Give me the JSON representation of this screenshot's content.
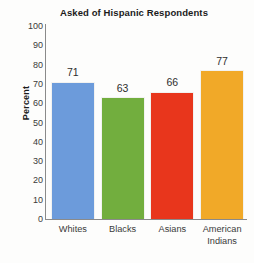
{
  "chart_data": {
    "type": "bar",
    "title": "Asked of Hispanic Respondents",
    "xlabel": "",
    "ylabel": "Percent",
    "categories": [
      "Whites",
      "Blacks",
      "Asians",
      "American Indians"
    ],
    "values": [
      71,
      63,
      66,
      77
    ],
    "ylim": [
      0,
      100
    ],
    "yticks": [
      100,
      90,
      80,
      70,
      60,
      50,
      40,
      30,
      20,
      10,
      0
    ],
    "ytick_labels": [
      "100",
      "90",
      "80",
      "70",
      "60",
      "50",
      "40",
      "30",
      "20",
      "10",
      "0"
    ],
    "value_labels": [
      "71",
      "63",
      "66",
      "77"
    ],
    "grid": false,
    "legend": null,
    "legend_position": "none",
    "bar_colors": [
      "#6C9BDB",
      "#72AE3E",
      "#E8361C",
      "#F1A928"
    ],
    "bar_border_color": "#F2F2F0",
    "axis_color": "#8A8A8A",
    "text_color": "#3A3A3A",
    "title_color": "#1B1B1B",
    "background": "#FDFDFC",
    "category_lines": [
      [
        "Whites"
      ],
      [
        "Blacks"
      ],
      [
        "Asians"
      ],
      [
        "American",
        "Indians"
      ]
    ]
  }
}
